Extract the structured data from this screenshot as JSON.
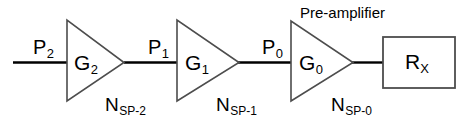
{
  "diagram": {
    "stroke_color": "#000000",
    "amplifier_edge_color": "#4d4d4d",
    "box_edge_color": "#4d4d4d",
    "background": "#ffffff",
    "amplifiers": [
      {
        "id": "amp-g2",
        "gain_label": "G",
        "gain_sub": "2",
        "noise_label": "N",
        "noise_sub": "SP-2",
        "input_power_label": "P",
        "input_power_sub": "2",
        "caption": ""
      },
      {
        "id": "amp-g1",
        "gain_label": "G",
        "gain_sub": "1",
        "noise_label": "N",
        "noise_sub": "SP-1",
        "input_power_label": "P",
        "input_power_sub": "1",
        "caption": ""
      },
      {
        "id": "amp-g0",
        "gain_label": "G",
        "gain_sub": "0",
        "noise_label": "N",
        "noise_sub": "SP-0",
        "input_power_label": "P",
        "input_power_sub": "0",
        "caption": "Pre-amplifier"
      }
    ],
    "receiver": {
      "id": "receiver-rx",
      "label": "R",
      "label_sub": "X"
    }
  }
}
